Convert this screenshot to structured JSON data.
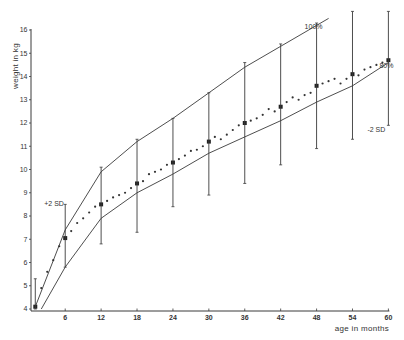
{
  "chart_data": {
    "type": "line",
    "title": "",
    "xlabel": "age in months",
    "ylabel": "weight in kg",
    "xlim": [
      0,
      60
    ],
    "ylim": [
      4,
      16
    ],
    "grid": false,
    "x_ticks": [
      6,
      12,
      18,
      24,
      30,
      36,
      42,
      48,
      54,
      60
    ],
    "y_ticks": [
      4,
      5,
      6,
      7,
      8,
      9,
      10,
      11,
      12,
      13,
      14,
      15,
      16
    ],
    "series": [
      {
        "name": "100%",
        "style": "line",
        "x": [
          1,
          6,
          12,
          18,
          24,
          30,
          36,
          42,
          48,
          50
        ],
        "values": [
          4.1,
          7.4,
          9.9,
          11.2,
          12.2,
          13.3,
          14.4,
          15.3,
          16.2,
          16.5
        ]
      },
      {
        "name": "80%",
        "style": "line",
        "x": [
          2,
          6,
          12,
          18,
          24,
          30,
          36,
          42,
          48,
          54,
          60
        ],
        "values": [
          4.0,
          5.8,
          7.9,
          9.0,
          9.8,
          10.7,
          11.4,
          12.1,
          12.9,
          13.6,
          14.6
        ]
      },
      {
        "name": "mean",
        "style": "large-points",
        "x": [
          1,
          6,
          12,
          18,
          24,
          30,
          36,
          42,
          48,
          54,
          60
        ],
        "values": [
          4.1,
          7.05,
          8.5,
          9.4,
          10.3,
          11.2,
          12.0,
          12.7,
          13.6,
          14.1,
          14.7
        ]
      },
      {
        "name": "monthly mean",
        "style": "small-points",
        "x": [
          2,
          3,
          4,
          5,
          7,
          8,
          9,
          10,
          11,
          13,
          14,
          15,
          16,
          17,
          19,
          20,
          21,
          22,
          23,
          25,
          26,
          27,
          28,
          29,
          31,
          32,
          33,
          34,
          35,
          37,
          38,
          39,
          40,
          41,
          43,
          44,
          45,
          46,
          47,
          49,
          50,
          51,
          52,
          53,
          55,
          56,
          57,
          58,
          59
        ],
        "values": [
          4.9,
          5.6,
          6.1,
          6.7,
          7.35,
          7.7,
          7.9,
          8.15,
          8.4,
          8.65,
          8.8,
          8.9,
          9.0,
          9.2,
          9.5,
          9.8,
          9.9,
          10.0,
          10.2,
          10.45,
          10.6,
          10.8,
          10.85,
          11.0,
          11.4,
          11.3,
          11.5,
          11.7,
          11.9,
          12.1,
          12.2,
          12.35,
          12.6,
          12.5,
          12.9,
          13.1,
          13.0,
          13.2,
          13.3,
          13.7,
          13.8,
          13.9,
          13.7,
          13.9,
          14.05,
          14.3,
          14.4,
          14.5,
          14.6
        ]
      },
      {
        "name": "±2 SD",
        "style": "error-bars",
        "x": [
          1,
          6,
          12,
          18,
          24,
          30,
          36,
          42,
          48,
          54,
          60
        ],
        "upper": [
          5.3,
          8.5,
          10.1,
          11.3,
          12.2,
          13.3,
          14.6,
          15.4,
          16.3,
          16.8,
          16.8
        ],
        "lower": [
          4.0,
          5.8,
          6.8,
          7.3,
          8.4,
          8.9,
          9.4,
          10.2,
          10.9,
          11.3,
          11.9
        ]
      }
    ],
    "annotations": [
      {
        "text": "100%",
        "x": 46,
        "y": 16.05
      },
      {
        "text": "80%",
        "x": 58.5,
        "y": 14.35
      },
      {
        "text": "+2 SD",
        "x": 2.5,
        "y": 8.45
      },
      {
        "text": "-2 SD",
        "x": 56.5,
        "y": 11.6
      }
    ]
  },
  "labels": {
    "xlabel": "age in months",
    "ylabel": "weight in kg",
    "plus_2sd": "+2 SD",
    "minus_2sd": "-2 SD",
    "p100": "100%",
    "p80": "80%"
  }
}
